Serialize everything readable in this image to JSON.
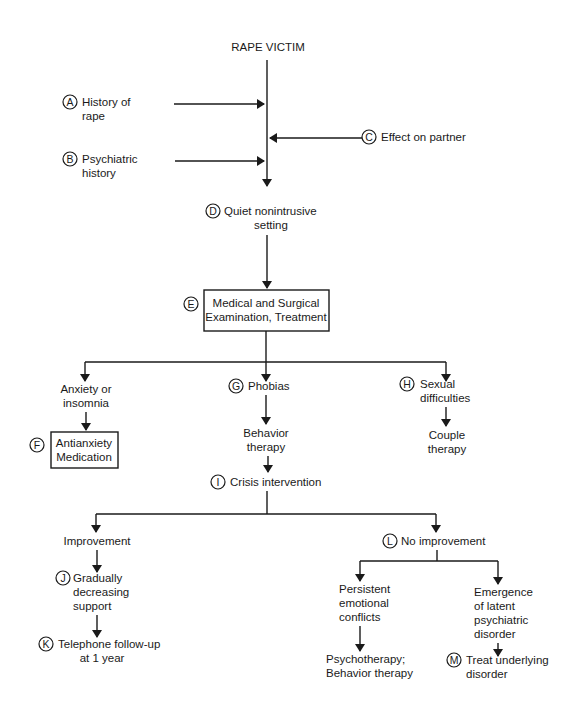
{
  "diagram": {
    "type": "flowchart",
    "root": "RAPE VICTIM",
    "inputs": [
      {
        "letter": "A",
        "lines": [
          "History of",
          "rape"
        ]
      },
      {
        "letter": "B",
        "lines": [
          "Psychiatric",
          "history"
        ]
      },
      {
        "letter": "C",
        "lines": [
          "Effect on partner"
        ]
      }
    ],
    "nodes": {
      "d": {
        "letter": "D",
        "lines": [
          "Quiet nonintrusive",
          "setting"
        ]
      },
      "e": {
        "letter": "E",
        "lines": [
          "Medical and Surgical",
          "Examination, Treatment"
        ]
      },
      "anxiety": {
        "lines": [
          "Anxiety or",
          "insomnia"
        ]
      },
      "f": {
        "letter": "F",
        "lines": [
          "Antianxiety",
          "Medication"
        ]
      },
      "g": {
        "letter": "G",
        "lines": [
          "Phobias"
        ]
      },
      "behavior": {
        "lines": [
          "Behavior",
          "therapy"
        ]
      },
      "h": {
        "letter": "H",
        "lines": [
          "Sexual",
          "difficulties"
        ]
      },
      "couple": {
        "lines": [
          "Couple",
          "therapy"
        ]
      },
      "i": {
        "letter": "I",
        "lines": [
          "Crisis intervention"
        ]
      },
      "improvement": {
        "lines": [
          "Improvement"
        ]
      },
      "j": {
        "letter": "J",
        "lines": [
          "Gradually",
          "decreasing",
          "support"
        ]
      },
      "k": {
        "letter": "K",
        "lines": [
          "Telephone follow-up",
          "at 1 year"
        ]
      },
      "l": {
        "letter": "L",
        "lines": [
          "No improvement"
        ]
      },
      "persistent": {
        "lines": [
          "Persistent",
          "emotional",
          "conflicts"
        ]
      },
      "psychotherapy": {
        "lines": [
          "Psychotherapy;",
          "Behavior therapy"
        ]
      },
      "emergence": {
        "lines": [
          "Emergence",
          "of latent",
          "psychiatric",
          "disorder"
        ]
      },
      "m": {
        "letter": "M",
        "lines": [
          "Treat underlying",
          "disorder"
        ]
      }
    },
    "edges": [
      [
        "root",
        "d"
      ],
      [
        "A",
        "main"
      ],
      [
        "B",
        "main"
      ],
      [
        "C",
        "main"
      ],
      [
        "d",
        "e"
      ],
      [
        "e",
        "anxiety"
      ],
      [
        "e",
        "g"
      ],
      [
        "e",
        "h"
      ],
      [
        "anxiety",
        "f"
      ],
      [
        "g",
        "behavior"
      ],
      [
        "behavior",
        "i"
      ],
      [
        "h",
        "couple"
      ],
      [
        "i",
        "improvement"
      ],
      [
        "i",
        "l"
      ],
      [
        "improvement",
        "j"
      ],
      [
        "j",
        "k"
      ],
      [
        "l",
        "persistent"
      ],
      [
        "l",
        "emergence"
      ],
      [
        "persistent",
        "psychotherapy"
      ],
      [
        "emergence",
        "m"
      ]
    ],
    "colors": {
      "ink": "#1a1a1a",
      "background": "#ffffff"
    }
  }
}
